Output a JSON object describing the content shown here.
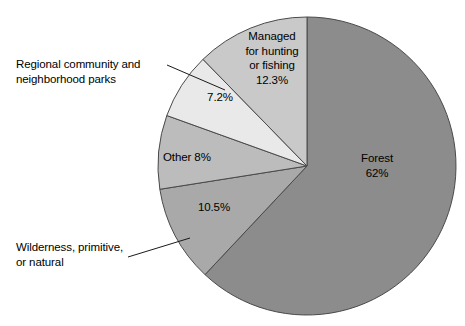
{
  "chart_data": {
    "type": "pie",
    "title": "",
    "subtitle": "",
    "xlabel": "",
    "ylabel": "",
    "legend_position": "none",
    "grid": false,
    "total_percent": 100,
    "start_angle_deg": 0,
    "direction": "clockwise",
    "categories": [
      "Forest",
      "Wilderness, primitive, or natural",
      "Other",
      "Regional community and neighborhood parks",
      "Managed for hunting or fishing"
    ],
    "values": [
      62,
      10.5,
      8,
      7.2,
      12.3
    ],
    "slices": [
      {
        "name": "Forest",
        "label": "Forest",
        "value": 62,
        "value_label": "62%",
        "color": "#8c8c8c",
        "label_placement": "inside",
        "start_deg": 0,
        "end_deg": 223.2
      },
      {
        "name": "Wilderness, primitive, or natural",
        "label": "Wilderness, primitive,\nor natural",
        "value": 10.5,
        "value_label": "10.5%",
        "color": "#a9a9a9",
        "label_placement": "callout",
        "start_deg": 223.2,
        "end_deg": 261.0
      },
      {
        "name": "Other",
        "label": "Other 8%",
        "value": 8,
        "value_label": "8%",
        "color": "#bcbcbc",
        "label_placement": "inside",
        "start_deg": 261.0,
        "end_deg": 289.8
      },
      {
        "name": "Regional community and neighborhood parks",
        "label": "Regional community and\nneighborhood parks",
        "value": 7.2,
        "value_label": "7.2%",
        "color": "#e9e9e9",
        "label_placement": "callout",
        "start_deg": 289.8,
        "end_deg": 315.72
      },
      {
        "name": "Managed for hunting or fishing",
        "label": "Managed\nfor hunting\nor fishing",
        "value": 12.3,
        "value_label": "12.3%",
        "color": "#c9c9c9",
        "label_placement": "inside",
        "start_deg": 315.72,
        "end_deg": 360.0
      }
    ]
  },
  "labels": {
    "forest": "Forest\n62%",
    "managed": "Managed\nfor hunting\nor fishing\n12.3%",
    "regional_pct": "7.2%",
    "regional_text": "Regional community and\nneighborhood parks",
    "other": "Other 8%",
    "wilderness_pct": "10.5%",
    "wilderness_text": "Wilderness, primitive,\nor natural"
  },
  "colors": {
    "forest": "#8c8c8c",
    "wilderness": "#a9a9a9",
    "other": "#bcbcbc",
    "regional": "#e9e9e9",
    "managed": "#c9c9c9",
    "outline": "#4a4a4a",
    "leader": "#1a1a1a",
    "background": "#ffffff",
    "text": "#000000"
  }
}
